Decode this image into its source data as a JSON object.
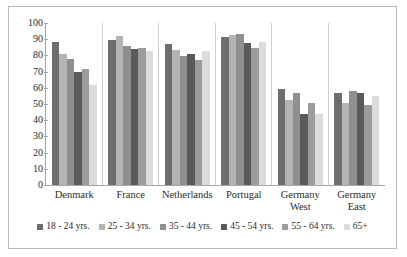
{
  "chart_data": {
    "type": "bar",
    "title": "",
    "subtitle": "",
    "xlabel": "",
    "ylabel": "",
    "ylim": [
      0,
      100
    ],
    "ytick_step": 10,
    "yticks": [
      0,
      10,
      20,
      30,
      40,
      50,
      60,
      70,
      80,
      90,
      100
    ],
    "grid": false,
    "legend_position": "bottom",
    "orientation": "vertical",
    "grouping": "clustered",
    "categories": [
      "Denmark",
      "France",
      "Netherlands",
      "Portugal",
      "Germany\nWest",
      "Germany\nEast"
    ],
    "series": [
      {
        "name": "18 - 24 yrs.",
        "color": "#6e6e6e",
        "values": [
          88,
          89.5,
          87,
          91.5,
          59.5,
          57
        ]
      },
      {
        "name": "25 - 34 yrs.",
        "color": "#b4b4b4",
        "values": [
          81,
          92,
          83.5,
          92.5,
          52.5,
          50.5
        ]
      },
      {
        "name": "35 - 44 yrs.",
        "color": "#8f8f8f",
        "values": [
          78,
          86,
          79.5,
          93,
          57,
          58
        ]
      },
      {
        "name": "45 - 54 yrs.",
        "color": "#5a5a5a",
        "values": [
          70,
          84,
          81,
          87.5,
          44,
          57
        ]
      },
      {
        "name": "55 - 64 yrs.",
        "color": "#9c9c9c",
        "values": [
          71.5,
          84.5,
          77,
          84.5,
          50.5,
          49.5
        ]
      },
      {
        "name": "65+",
        "color": "#dcdcdc",
        "values": [
          62,
          82.5,
          82.5,
          88,
          44,
          55
        ]
      }
    ]
  },
  "legend": {
    "items": [
      {
        "label": "18 - 24 yrs."
      },
      {
        "label": "25 - 34 yrs."
      },
      {
        "label": "35 - 44 yrs."
      },
      {
        "label": "45 - 54 yrs."
      },
      {
        "label": "55 - 64 yrs."
      },
      {
        "label": "65+"
      }
    ]
  }
}
